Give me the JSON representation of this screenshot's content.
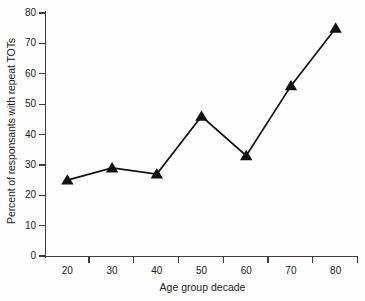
{
  "chart_data": {
    "type": "line",
    "title": "",
    "xlabel": "Age group decade",
    "ylabel": "Percent of responsants with repeat TOTs",
    "x": [
      20,
      30,
      40,
      50,
      60,
      70,
      80
    ],
    "categories": [
      "20",
      "30",
      "40",
      "50",
      "60",
      "70",
      "80"
    ],
    "values": [
      25,
      29,
      27,
      46,
      33,
      56,
      75
    ],
    "series": [
      {
        "name": "Percent with repeat TOTs",
        "values": [
          25,
          29,
          27,
          46,
          33,
          56,
          75
        ],
        "marker": "triangle",
        "color": "#111111"
      }
    ],
    "xlim": [
      15,
      85
    ],
    "ylim": [
      0,
      80
    ],
    "ytick_labels": [
      "0",
      "10",
      "20",
      "30",
      "40",
      "50",
      "60",
      "70",
      "80"
    ],
    "ytick_values": [
      0,
      10,
      20,
      30,
      40,
      50,
      60,
      70,
      80
    ],
    "xtick_labels": [
      "20",
      "30",
      "40",
      "50",
      "60",
      "70",
      "80"
    ],
    "xtick_values": [
      20,
      30,
      40,
      50,
      60,
      70,
      80
    ],
    "grid": false,
    "legend": "none",
    "line_color": "#111111",
    "axis_color": "#3d3d3d",
    "background": "#fefefe"
  }
}
